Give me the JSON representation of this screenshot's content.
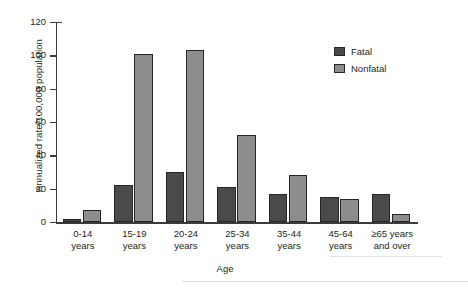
{
  "chart_data": {
    "type": "bar",
    "title": "",
    "xlabel": "Age",
    "ylabel": "Annualized rate/100,000 population",
    "ylim": [
      0,
      120
    ],
    "yticks": [
      0,
      20,
      40,
      60,
      80,
      100,
      120
    ],
    "grid": false,
    "legend_position": "top-right",
    "categories": [
      "0-14\nyears",
      "15-19\nyears",
      "20-24\nyears",
      "25-34\nyears",
      "35-44\nyears",
      "45-64\nyears",
      "≥65 years\nand over"
    ],
    "category_lines": [
      [
        "0-14",
        "years"
      ],
      [
        "15-19",
        "years"
      ],
      [
        "20-24",
        "years"
      ],
      [
        "25-34",
        "years"
      ],
      [
        "35-44",
        "years"
      ],
      [
        "45-64",
        "years"
      ],
      [
        "≥65 years",
        "and over"
      ]
    ],
    "series": [
      {
        "name": "Fatal",
        "color": "#4a4a4a",
        "values": [
          2,
          22,
          30,
          21,
          17,
          15,
          17
        ]
      },
      {
        "name": "Nonfatal",
        "color": "#8d8d8d",
        "values": [
          7,
          101,
          103,
          52,
          28,
          14,
          5
        ]
      }
    ]
  },
  "legend": {
    "items": [
      {
        "label": "Fatal",
        "color": "#4a4a4a"
      },
      {
        "label": "Nonfatal",
        "color": "#8d8d8d"
      }
    ]
  },
  "axes": {
    "y_title": "Annualized rate/100,000 population",
    "x_title": "Age",
    "y_tick_labels": [
      "120",
      "100",
      "80",
      "60",
      "40",
      "20",
      "0"
    ]
  }
}
